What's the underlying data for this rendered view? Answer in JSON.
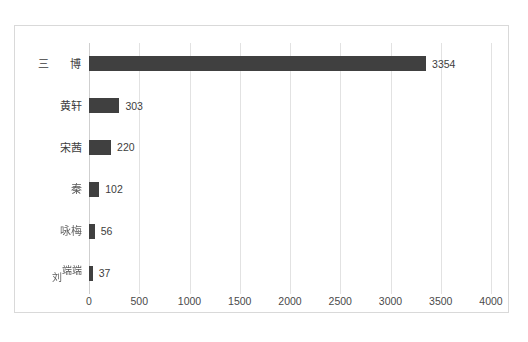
{
  "chart_data": {
    "type": "bar",
    "orientation": "horizontal",
    "title": "",
    "subtitle": "",
    "xlabel": "",
    "ylabel": "",
    "xlim": [
      0,
      4000
    ],
    "x_ticks": [
      "0",
      "500",
      "1000",
      "1500",
      "2000",
      "2500",
      "3000",
      "3500",
      "4000"
    ],
    "x_tick_values": [
      0,
      500,
      1000,
      1500,
      2000,
      2500,
      3000,
      3500,
      4000
    ],
    "grid": true,
    "grid_axis": "x",
    "legend": false,
    "legend_position": "none",
    "bar_color": "#404040",
    "gridline_color": "#e2e2e2",
    "border_color": "#d9d9d9",
    "background_color": "#ffffff",
    "categories": [
      "三 博",
      "黄轩",
      "宋茜",
      "秦",
      "咏梅",
      "刘端端"
    ],
    "values": [
      3354,
      303,
      220,
      102,
      56,
      37
    ],
    "value_labels": [
      "3354",
      "303",
      "220",
      "102",
      "56",
      "37"
    ],
    "bars": [
      {
        "category": "三 博",
        "value": 3354,
        "label": "3354",
        "label_style": "wide-gap"
      },
      {
        "category": "黄轩",
        "value": 303,
        "label": "303",
        "label_style": "plain"
      },
      {
        "category": "宋茜",
        "value": 220,
        "label": "220",
        "label_style": "plain"
      },
      {
        "category": "秦",
        "value": 102,
        "label": "102",
        "label_style": "smudge-a"
      },
      {
        "category": "咏梅",
        "value": 56,
        "label": "56",
        "label_style": "smudge-b"
      },
      {
        "category": "刘端端",
        "value": 37,
        "label": "37",
        "label_style": "offset-stack",
        "lead_char": "刘",
        "tail_chars": "端端"
      }
    ]
  }
}
